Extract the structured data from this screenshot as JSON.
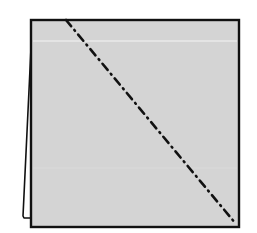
{
  "diagram": {
    "colors": {
      "background": "#ffffff",
      "paper_fill": "#d4d4d4",
      "outline": "#111111",
      "highlight_line": "#f2f2f2",
      "fold_line": "#111111"
    },
    "square": {
      "x": 31,
      "y": 20,
      "width": 208,
      "height": 207
    },
    "flap": {
      "points": "31,48 23,216 31,218"
    },
    "highlight": {
      "x1": 32,
      "y1": 41,
      "x2": 238,
      "y2": 41
    },
    "fold_line": {
      "style": "dash-dot",
      "x1": 66,
      "y1": 20,
      "x2": 236,
      "y2": 224
    }
  }
}
